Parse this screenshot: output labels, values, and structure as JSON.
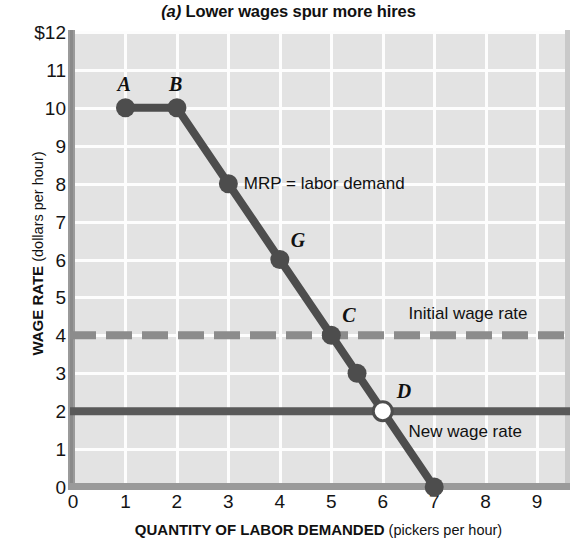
{
  "chart_data": {
    "type": "line",
    "title": "(a) Lower wages spur more hires",
    "title_panel_letter": "(a)",
    "title_rest": " Lower wages spur more hires",
    "xlabel_strong": "QUANTITY OF LABOR DEMANDED",
    "xlabel_weak": " (pickers per hour)",
    "ylabel_strong": "WAGE RATE",
    "ylabel_weak": " (dollars per hour)",
    "xlim": [
      0,
      9.6
    ],
    "ylim": [
      0,
      12
    ],
    "grid": true,
    "legend_position": "inline-right",
    "x_ticks": [
      "1",
      "2",
      "3",
      "4",
      "5",
      "6",
      "7",
      "8",
      "9"
    ],
    "x_tick_values": [
      1,
      2,
      3,
      4,
      5,
      6,
      7,
      8,
      9
    ],
    "y_ticks": [
      "$12",
      "11",
      "10",
      "9",
      "8",
      "7",
      "6",
      "5",
      "4",
      "3",
      "2",
      "1",
      "0"
    ],
    "y_tick_values": [
      12,
      11,
      10,
      9,
      8,
      7,
      6,
      5,
      4,
      3,
      2,
      1,
      0
    ],
    "series": [
      {
        "name": "MRP = labor demand",
        "color": "#4d4d4d",
        "x": [
          1,
          2,
          3,
          4,
          5,
          5.5,
          6,
          7
        ],
        "y": [
          10,
          10,
          8,
          6,
          4,
          3,
          2,
          0
        ]
      }
    ],
    "markers": [
      {
        "label": "A",
        "x": 1,
        "y": 10,
        "filled": true
      },
      {
        "label": "B",
        "x": 2,
        "y": 10,
        "filled": true
      },
      {
        "label": "",
        "x": 3,
        "y": 8,
        "filled": true
      },
      {
        "label": "G",
        "x": 4,
        "y": 6,
        "filled": true
      },
      {
        "label": "C",
        "x": 5,
        "y": 4,
        "filled": true
      },
      {
        "label": "",
        "x": 5.5,
        "y": 3,
        "filled": true
      },
      {
        "label": "D",
        "x": 6,
        "y": 2,
        "filled": false
      },
      {
        "label": "",
        "x": 7,
        "y": 0,
        "filled": true
      }
    ],
    "reference_lines": [
      {
        "name": "Initial wage rate",
        "y": 4,
        "style": "dashed",
        "color": "#8c8c8c",
        "label": "Initial wage rate"
      },
      {
        "name": "New wage rate",
        "y": 2,
        "style": "solid",
        "color": "#595959",
        "label": "New wage rate"
      }
    ],
    "annotations": [
      {
        "name": "mrp-label",
        "text": "MRP = labor demand",
        "x": 3.3,
        "y": 8
      },
      {
        "name": "initial-wage-label",
        "text": "Initial wage rate",
        "x": 6.5,
        "y": 4.55
      },
      {
        "name": "new-wage-label",
        "text": "New wage rate",
        "x": 6.5,
        "y": 1.45
      }
    ],
    "colors": {
      "plot_background": "#e3e3e3",
      "gridline": "#fdfdfd",
      "axis": "#9a9a9a",
      "series": "#4d4d4d",
      "initial_wage_line": "#8c8c8c",
      "new_wage_line": "#595959",
      "text": "#111111"
    }
  }
}
